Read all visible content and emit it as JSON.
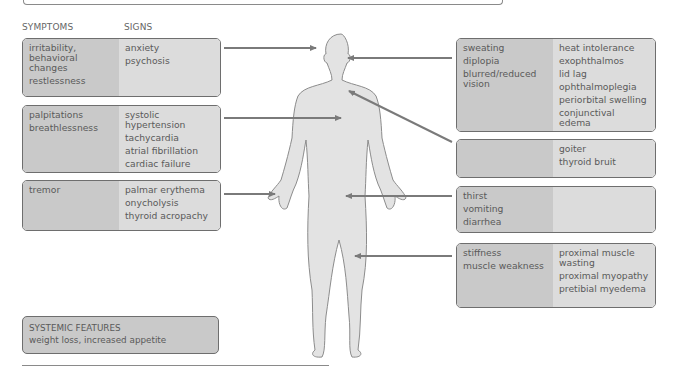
{
  "headers": {
    "symptoms": "SYMPTOMS",
    "signs": "SIGNS"
  },
  "left_boxes": [
    {
      "symptoms": [
        "irritability, behavioral changes",
        "restlessness"
      ],
      "signs": [
        "anxiety",
        "psychosis"
      ],
      "target": "head"
    },
    {
      "symptoms": [
        "palpitations",
        "breathlessness"
      ],
      "signs": [
        "systolic hypertension",
        "tachycardia",
        "atrial fibrillation",
        "cardiac failure"
      ],
      "target": "chest"
    },
    {
      "symptoms": [
        "tremor"
      ],
      "signs": [
        "palmar erythema",
        "onycholysis",
        "thyroid acropachy"
      ],
      "target": "hand"
    }
  ],
  "right_boxes": [
    {
      "symptoms": [
        "sweating",
        "diplopia",
        "blurred/reduced vision"
      ],
      "signs": [
        "heat intolerance",
        "exophthalmos",
        "lid lag",
        "ophthalmoplegia",
        "periorbital swelling",
        "conjunctival edema"
      ],
      "target": "eye"
    },
    {
      "symptoms": [],
      "signs": [
        "goiter",
        "thyroid bruit"
      ],
      "target": "neck"
    },
    {
      "symptoms": [
        "thirst",
        "vomiting",
        "diarrhea"
      ],
      "signs": [],
      "target": "abdomen"
    },
    {
      "symptoms": [
        "stiffness",
        "muscle weakness"
      ],
      "signs": [
        "proximal muscle wasting",
        "proximal myopathy",
        "pretibial myedema"
      ],
      "target": "thigh"
    }
  ],
  "systemic": {
    "title": "SYSTEMIC FEATURES",
    "text": "weight loss, increased appetite"
  },
  "colors": {
    "symptom_bg": "#c9c9c9",
    "sign_bg": "#dcdcdc",
    "border": "#6e6e6e",
    "arrow": "#7a7a7a",
    "body_fill": "#e3e3e3",
    "body_stroke": "#8c8c8c"
  }
}
